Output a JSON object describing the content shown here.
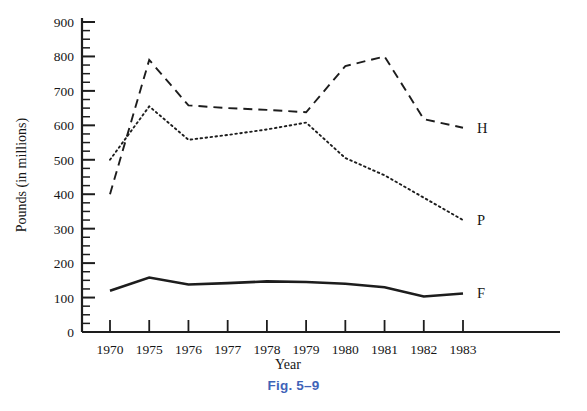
{
  "figure": {
    "caption": "Fig. 5–9"
  },
  "chart_data": {
    "type": "line",
    "title": "",
    "xlabel": "Year",
    "ylabel": "Pounds (in millions)",
    "categories": [
      "1970",
      "1975",
      "1976",
      "1977",
      "1978",
      "1979",
      "1980",
      "1981",
      "1982",
      "1983"
    ],
    "x": [
      1970,
      1975,
      1976,
      1977,
      1978,
      1979,
      1980,
      1981,
      1982,
      1983
    ],
    "ylim": [
      0,
      900
    ],
    "yticks": [
      0,
      100,
      200,
      300,
      400,
      500,
      600,
      700,
      800,
      900
    ],
    "ytick_labels": [
      "0",
      "100",
      "200",
      "300",
      "400",
      "500",
      "600",
      "700",
      "800",
      "900"
    ],
    "y_minor_tick_interval": 25,
    "grid": false,
    "legend_position": "right-end-labels",
    "series": [
      {
        "name": "H",
        "label": "H",
        "style": "dashed",
        "color": "#1d1d1d",
        "values": [
          400,
          790,
          658,
          650,
          645,
          638,
          772,
          800,
          618,
          593
        ]
      },
      {
        "name": "P",
        "label": "P",
        "style": "dotted",
        "color": "#1d1d1d",
        "values": [
          500,
          655,
          558,
          572,
          588,
          608,
          505,
          455,
          390,
          325
        ]
      },
      {
        "name": "F",
        "label": "F",
        "style": "solid",
        "color": "#1d1d1d",
        "values": [
          120,
          158,
          138,
          142,
          147,
          145,
          140,
          130,
          103,
          112
        ]
      }
    ]
  }
}
